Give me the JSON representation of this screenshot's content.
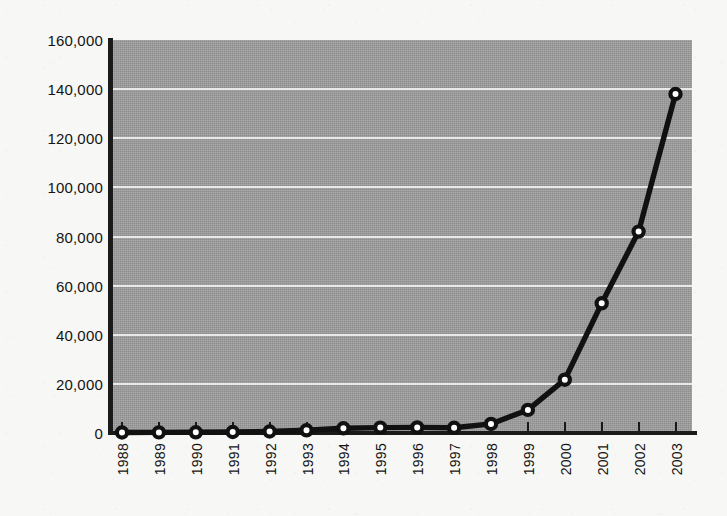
{
  "chart_data": {
    "type": "line",
    "title": "",
    "subtitle": "",
    "xlabel": "",
    "ylabel": "",
    "categories": [
      "1988",
      "1989",
      "1990",
      "1991",
      "1992",
      "1993",
      "1994",
      "1995",
      "1996",
      "1997",
      "1998",
      "1999",
      "2000",
      "2001",
      "2002",
      "2003"
    ],
    "values": [
      200,
      250,
      300,
      400,
      600,
      1100,
      1900,
      2200,
      2300,
      2100,
      3700,
      9400,
      21700,
      52800,
      82000,
      138000
    ],
    "series": [
      {
        "name": "",
        "values": [
          200,
          250,
          300,
          400,
          600,
          1100,
          1900,
          2200,
          2300,
          2100,
          3700,
          9400,
          21700,
          52800,
          82000,
          138000
        ]
      }
    ],
    "ylim": [
      0,
      160000
    ],
    "y_ticks": [
      0,
      20000,
      40000,
      60000,
      80000,
      100000,
      120000,
      140000,
      160000
    ],
    "y_tick_labels": [
      "0",
      "20,000",
      "40,000",
      "60,000",
      "80,000",
      "100,000",
      "120,000",
      "140,000",
      "160,000"
    ],
    "x_tick_labels": [
      "1988",
      "1989",
      "1990",
      "1991",
      "1992",
      "1993",
      "1994",
      "1995",
      "1996",
      "1997",
      "1998",
      "1999",
      "2000",
      "2001",
      "2002",
      "2003"
    ],
    "grid": "horizontal",
    "legend": "none",
    "annotations": [],
    "colors": {
      "plot_background": "#9c9c9c",
      "gridline": "#f0f0ee",
      "line": "#111111",
      "marker_fill": "#ffffff",
      "marker_stroke": "#111111",
      "axis": "#1a1a1a",
      "page_background": "#f7f7f5",
      "text": "#141414"
    }
  },
  "geometry": {
    "plot_left": 113,
    "plot_top": 40,
    "plot_width": 579,
    "plot_height": 393,
    "first_point_x": 122,
    "point_spacing": 36.9
  }
}
